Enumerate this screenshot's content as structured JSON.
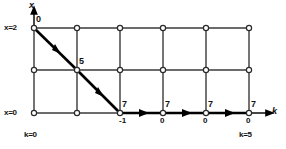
{
  "figure": {
    "type": "trellis-diagram",
    "axes": {
      "vertical_name": "x",
      "horizontal_name": "k",
      "vertical_top_value": "x=2",
      "vertical_bottom_value": "x=0",
      "horizontal_left_value": "k=0",
      "horizontal_right_value": "k=5"
    },
    "grid": {
      "columns": 6,
      "rows": 3,
      "node_glyph": "open-circle"
    },
    "path_labels": [
      {
        "id": "start",
        "text": "0",
        "position": "above-right"
      },
      {
        "id": "mid",
        "text": "5",
        "position": "above-right"
      },
      {
        "id": "corner",
        "text": "7",
        "position": "above-right"
      },
      {
        "id": "corner_below",
        "text": "-1",
        "position": "below-right"
      },
      {
        "id": "step1",
        "text": "7",
        "position": "above-right"
      },
      {
        "id": "step1_below",
        "text": "0",
        "position": "below"
      },
      {
        "id": "step2",
        "text": "7",
        "position": "above-right"
      },
      {
        "id": "step2_below",
        "text": "0",
        "position": "below"
      },
      {
        "id": "step3",
        "text": "7",
        "position": "above-right"
      },
      {
        "id": "step3_below",
        "text": "0",
        "position": "below"
      }
    ],
    "colors": {
      "grid_line": "#3a3a3a",
      "path_line": "#000000",
      "node_fill": "#ffffff",
      "text": "#111111"
    }
  }
}
